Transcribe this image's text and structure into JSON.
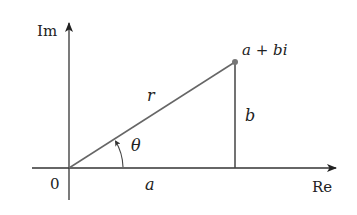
{
  "diagram": {
    "type": "complex-plane-polar-form",
    "labels": {
      "imag_axis": "Im",
      "real_axis": "Re",
      "origin": "0",
      "point": "a + bi",
      "modulus": "r",
      "imag_part": "b",
      "real_part": "a",
      "angle": "θ"
    },
    "colors": {
      "axis": "#333333",
      "segment": "#555555",
      "text": "#222222",
      "point": "#666666"
    }
  }
}
